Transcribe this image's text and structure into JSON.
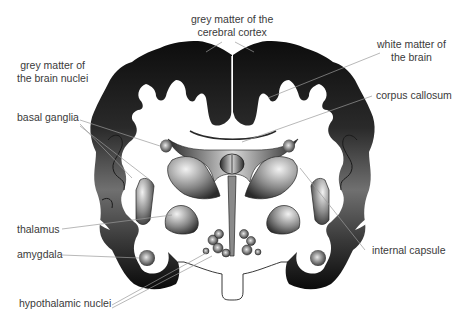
{
  "diagram": {
    "labels": {
      "grey_cortex": [
        "grey matter of the",
        "cerebral cortex"
      ],
      "grey_nuclei": [
        "grey matter of",
        "the brain nuclei"
      ],
      "white_matter": [
        "white matter of",
        "the brain"
      ],
      "corpus_callosum": "corpus callosum",
      "basal_ganglia": "basal ganglia",
      "thalamus": "thalamus",
      "amygdala": "amygdala",
      "internal_capsule": "internal capsule",
      "hypothalamic_nuclei": "hypothalamic nuclei"
    },
    "colors": {
      "grey_matter_dark": "#111111",
      "grey_matter_mid": "#6a6a6a",
      "nuclei_light": "#e6e6e6",
      "leader_line": "#9a9a9a",
      "label_text": "#3a3a3a",
      "background": "#ffffff"
    }
  }
}
